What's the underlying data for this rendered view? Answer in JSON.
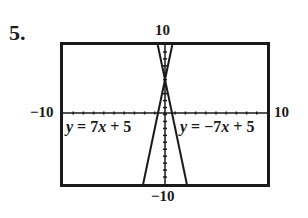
{
  "problem_number": "5.",
  "chart_data": {
    "type": "line",
    "title": "",
    "xlabel": "",
    "ylabel": "",
    "xlim": [
      -10,
      10
    ],
    "ylim": [
      -10,
      10
    ],
    "xscale_ticks": 1,
    "yscale_ticks": 1,
    "window_labels": {
      "xmin": "−10",
      "xmax": "10",
      "ymin": "−10",
      "ymax": "10"
    },
    "grid": false,
    "series": [
      {
        "name": "y = 7x + 5",
        "slope": 7,
        "intercept": 5,
        "x": [
          -2.14,
          0.71
        ],
        "y": [
          -10,
          10
        ]
      },
      {
        "name": "y = −7x + 5",
        "slope": -7,
        "intercept": 5,
        "x": [
          -0.71,
          2.14
        ],
        "y": [
          10,
          -10
        ]
      }
    ],
    "annotations": [
      {
        "text": "y = 7x + 5",
        "position": "left of lines, just below x-axis"
      },
      {
        "text": "y = −7x + 5",
        "position": "right of lines, just below x-axis"
      }
    ]
  },
  "labels": {
    "ymax": "10",
    "ymin": "−10",
    "xmin": "−10",
    "xmax": "10",
    "eq1_prefix": "y",
    "eq1_rest": " = 7",
    "eq1_x": "x",
    "eq1_end": " + 5",
    "eq2_prefix": "y",
    "eq2_rest": " = −7",
    "eq2_x": "x",
    "eq2_end": " + 5"
  }
}
